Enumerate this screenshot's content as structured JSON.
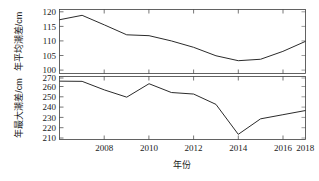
{
  "figure": {
    "background_color": "#ffffff",
    "line_color": "#2b2b2b",
    "axis_color": "#3c3c3c",
    "xlabel": "年份"
  },
  "chart_data": [
    {
      "type": "line",
      "panel": "top",
      "title": "",
      "xlabel": "",
      "ylabel": "年平均潮差/cm",
      "xlim": [
        2007,
        2018
      ],
      "ylim": [
        99,
        121
      ],
      "yticks": [
        100,
        105,
        110,
        115,
        120
      ],
      "ytick_labels": [
        "100",
        "105",
        "110",
        "115",
        "120"
      ],
      "xticks": [
        2008,
        2010,
        2012,
        2014,
        2016,
        2018
      ],
      "xtick_labels": [
        "2008",
        "2010",
        "2012",
        "2014",
        "2016",
        "2018"
      ],
      "grid": false,
      "legend": "none",
      "x": [
        2007,
        2008,
        2009,
        2010,
        2011,
        2012,
        2013,
        2014,
        2015,
        2016,
        2017,
        2018
      ],
      "values": [
        117.5,
        119.0,
        115.7,
        112.3,
        112.0,
        110.2,
        108.0,
        105.1,
        103.4,
        103.9,
        106.6,
        110.0
      ]
    },
    {
      "type": "line",
      "panel": "bottom",
      "title": "",
      "xlabel": "年份",
      "ylabel": "年最大潮差/cm",
      "xlim": [
        2007,
        2018
      ],
      "ylim": [
        210,
        271
      ],
      "yticks": [
        210,
        220,
        230,
        240,
        250,
        260,
        270
      ],
      "ytick_labels": [
        "210",
        "220",
        "230",
        "240",
        "250",
        "260",
        "270"
      ],
      "xticks": [
        2008,
        2010,
        2012,
        2014,
        2016,
        2018
      ],
      "xtick_labels": [
        "2008",
        "2010",
        "2012",
        "2014",
        "2016",
        "2018"
      ],
      "grid": false,
      "legend": "none",
      "x": [
        2007,
        2008,
        2009,
        2010,
        2011,
        2012,
        2013,
        2014,
        2015,
        2016,
        2017,
        2018
      ],
      "values": [
        266.5,
        266.3,
        258.0,
        251.0,
        264.0,
        255.5,
        254.0,
        244.0,
        215.0,
        230.0,
        234.0,
        238.0
      ]
    }
  ]
}
